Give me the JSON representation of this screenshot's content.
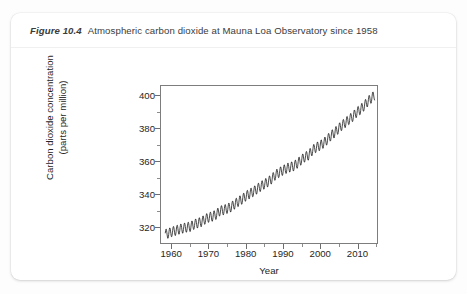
{
  "figure": {
    "number": "Figure 10.4",
    "caption": "Atmospheric carbon dioxide at Mauna Loa Observatory since 1958"
  },
  "chart_data": {
    "type": "line",
    "title": "Atmospheric carbon dioxide at Mauna Loa Observatory since 1958",
    "xlabel": "Year",
    "ylabel": "Carbon dioxide concentration\n(parts per million)",
    "ylabel_line1": "Carbon dioxide concentration",
    "ylabel_line2": "(parts per million)",
    "xlim": [
      1957.0,
      2015.5
    ],
    "ylim": [
      310,
      406
    ],
    "grid": false,
    "legend": false,
    "line_color": "#1a1a1a",
    "x_major_ticks": [
      1960,
      1970,
      1980,
      1990,
      2000,
      2010
    ],
    "x_minor_ticks": [
      1965,
      1975,
      1985,
      1995,
      2005,
      2015
    ],
    "x_tick_labels": [
      "1960",
      "1970",
      "1980",
      "1990",
      "2000",
      "2010"
    ],
    "y_major_ticks": [
      320,
      340,
      360,
      380,
      400
    ],
    "y_minor_ticks": [
      330,
      350,
      370,
      390
    ],
    "y_tick_labels": [
      "320",
      "340",
      "360",
      "380",
      "400"
    ],
    "seasonal_amplitude_ppm": 3.0,
    "seasonal_peak_month": 5,
    "series_name": "Monthly mean CO2 (Keeling Curve)",
    "annual_mean": {
      "x": [
        1958,
        1959,
        1960,
        1961,
        1962,
        1963,
        1964,
        1965,
        1966,
        1967,
        1968,
        1969,
        1970,
        1971,
        1972,
        1973,
        1974,
        1975,
        1976,
        1977,
        1978,
        1979,
        1980,
        1981,
        1982,
        1983,
        1984,
        1985,
        1986,
        1987,
        1988,
        1989,
        1990,
        1991,
        1992,
        1993,
        1994,
        1995,
        1996,
        1997,
        1998,
        1999,
        2000,
        2001,
        2002,
        2003,
        2004,
        2005,
        2006,
        2007,
        2008,
        2009,
        2010,
        2011,
        2012,
        2013,
        2014
      ],
      "y": [
        315.3,
        315.9,
        316.9,
        317.6,
        318.4,
        319.0,
        319.6,
        320.0,
        321.4,
        322.2,
        323.0,
        324.6,
        325.7,
        326.3,
        327.5,
        329.7,
        330.2,
        331.1,
        332.0,
        333.8,
        335.4,
        336.8,
        338.7,
        340.1,
        341.4,
        343.0,
        344.6,
        346.0,
        347.4,
        349.2,
        351.6,
        353.1,
        354.4,
        355.6,
        356.4,
        357.1,
        358.8,
        360.8,
        362.6,
        363.7,
        366.7,
        368.4,
        369.5,
        371.0,
        373.1,
        375.6,
        377.4,
        379.7,
        381.9,
        383.7,
        385.6,
        387.4,
        389.9,
        391.6,
        393.8,
        396.5,
        398.6
      ]
    }
  },
  "axes": {
    "x_title": "Year",
    "y_title_line1": "Carbon dioxide concentration",
    "y_title_line2": "(parts per million)"
  }
}
